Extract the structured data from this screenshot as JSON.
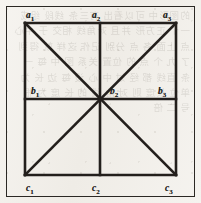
{
  "figure": {
    "kind": "geometric-diagram",
    "background_color": "#f4f2ee",
    "ink_color": "#231f1c",
    "outer_frame": {
      "stroke_color": "#2b2824",
      "stroke_width": 1.4
    },
    "inner_square": {
      "stroke_color": "#231f1c",
      "stroke_width": 2.6,
      "left": 25,
      "top": 23,
      "right": 176,
      "bottom": 175
    },
    "center_point": {
      "x": 100,
      "y": 99
    },
    "lines": [
      {
        "name": "square-top-edge",
        "x1": 25,
        "y1": 23,
        "x2": 176,
        "y2": 23
      },
      {
        "name": "square-right-edge",
        "x1": 176,
        "y1": 23,
        "x2": 176,
        "y2": 175
      },
      {
        "name": "square-bottom-edge",
        "x1": 176,
        "y1": 175,
        "x2": 25,
        "y2": 175
      },
      {
        "name": "square-left-edge",
        "x1": 25,
        "y1": 175,
        "x2": 25,
        "y2": 23
      },
      {
        "name": "vertical-midline",
        "x1": 100,
        "y1": 23,
        "x2": 100,
        "y2": 175
      },
      {
        "name": "horizontal-midline",
        "x1": 25,
        "y1": 99,
        "x2": 176,
        "y2": 99
      },
      {
        "name": "diagonal-top-left-to-bottom-right",
        "x1": 25,
        "y1": 23,
        "x2": 176,
        "y2": 175
      },
      {
        "name": "diagonal-top-right-to-bottom-left",
        "x1": 176,
        "y1": 23,
        "x2": 25,
        "y2": 175
      }
    ],
    "labels": [
      {
        "id": "a1",
        "base": "a",
        "sub": "1",
        "x": 26,
        "y": 11,
        "anchor": "corner-top-left"
      },
      {
        "id": "a2",
        "base": "a",
        "sub": "2",
        "x": 92,
        "y": 11,
        "anchor": "midpoint-top"
      },
      {
        "id": "a3",
        "base": "a",
        "sub": "3",
        "x": 163,
        "y": 11,
        "anchor": "corner-top-right"
      },
      {
        "id": "b1",
        "base": "b",
        "sub": "1",
        "x": 31,
        "y": 87,
        "anchor": "midpoint-left"
      },
      {
        "id": "b2",
        "base": "b",
        "sub": "2",
        "x": 110,
        "y": 87,
        "anchor": "centre"
      },
      {
        "id": "b3",
        "base": "b",
        "sub": "3",
        "x": 158,
        "y": 87,
        "anchor": "midpoint-right"
      },
      {
        "id": "c1",
        "base": "c",
        "sub": "1",
        "x": 26,
        "y": 184,
        "anchor": "corner-bottom-left"
      },
      {
        "id": "c2",
        "base": "c",
        "sub": "2",
        "x": 92,
        "y": 184,
        "anchor": "midpoint-bottom"
      },
      {
        "id": "c3",
        "base": "c",
        "sub": "3",
        "x": 165,
        "y": 184,
        "anchor": "corner-bottom-right"
      }
    ],
    "bleed_through_text": "的图形中 可以看出 有三条 线段 组成 一个 正方形 并且 对角线 相交 于 中心 点 上面 各 点 分别 记作 这样 就 得到 了 九 个 点 的 位置 关系 图 中 每 一 条 直线 都 经 过 中 心 设 每 边 长 为 单位 长度 则 对 角 线 的 长 度 为 根 号 二 倍"
  }
}
